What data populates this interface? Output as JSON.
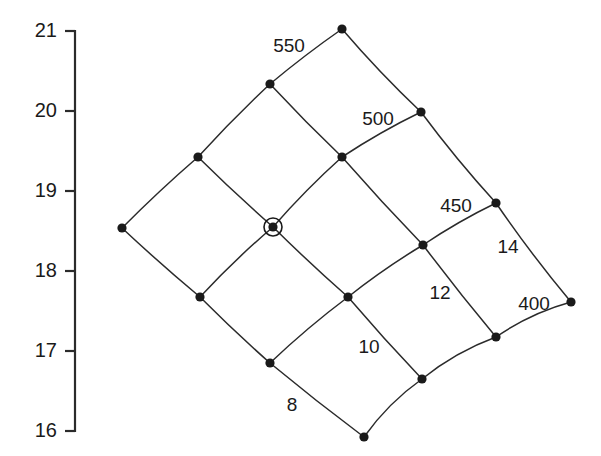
{
  "figure": {
    "background": "#ffffff",
    "ink": "#1a1a1a",
    "type": "curvilinear-grid-diagram"
  },
  "axis": {
    "name": "y-axis",
    "orientation": "vertical",
    "line": {
      "x": 75,
      "y_top": 31,
      "y_bottom": 431
    },
    "tick_length": 10,
    "ticks": [
      {
        "label": "21",
        "value": 21,
        "y": 31
      },
      {
        "label": "20",
        "value": 20,
        "y": 111
      },
      {
        "label": "19",
        "value": 19,
        "y": 191
      },
      {
        "label": "18",
        "value": 18,
        "y": 271
      },
      {
        "label": "17",
        "value": 17,
        "y": 351
      },
      {
        "label": "16",
        "value": 16,
        "y": 431
      }
    ]
  },
  "chart_data": {
    "type": "scatter",
    "title": "",
    "xlabel": "",
    "ylabel": "",
    "ylim": [
      16,
      21
    ],
    "grid": false,
    "iso_labels_family_a": [
      "550",
      "500",
      "450",
      "400"
    ],
    "iso_labels_family_b": [
      "8",
      "10",
      "12",
      "14"
    ],
    "nodes": [
      {
        "id": "n00",
        "x": 122,
        "y": 228,
        "highlight": false
      },
      {
        "id": "n01",
        "x": 198,
        "y": 157,
        "highlight": false
      },
      {
        "id": "n02",
        "x": 270,
        "y": 84,
        "highlight": false
      },
      {
        "id": "n03",
        "x": 342,
        "y": 29,
        "highlight": false
      },
      {
        "id": "n10",
        "x": 200,
        "y": 297,
        "highlight": false
      },
      {
        "id": "n11",
        "x": 273,
        "y": 227,
        "highlight": true
      },
      {
        "id": "n12",
        "x": 342,
        "y": 157,
        "highlight": false
      },
      {
        "id": "n13",
        "x": 421,
        "y": 112,
        "highlight": false
      },
      {
        "id": "n20",
        "x": 270,
        "y": 363,
        "highlight": false
      },
      {
        "id": "n21",
        "x": 348,
        "y": 297,
        "highlight": false
      },
      {
        "id": "n22",
        "x": 423,
        "y": 245,
        "highlight": false
      },
      {
        "id": "n23",
        "x": 496,
        "y": 203,
        "highlight": false
      },
      {
        "id": "n30",
        "x": 364,
        "y": 437,
        "highlight": false
      },
      {
        "id": "n31",
        "x": 422,
        "y": 379,
        "highlight": false
      },
      {
        "id": "n32",
        "x": 496,
        "y": 337,
        "highlight": false
      },
      {
        "id": "n33",
        "x": 571,
        "y": 302,
        "highlight": false
      }
    ],
    "labels": [
      {
        "text": "550",
        "x": 289,
        "y": 47
      },
      {
        "text": "500",
        "x": 378,
        "y": 120
      },
      {
        "text": "450",
        "x": 456,
        "y": 207
      },
      {
        "text": "400",
        "x": 534,
        "y": 305
      },
      {
        "text": "14",
        "x": 508,
        "y": 248
      },
      {
        "text": "12",
        "x": 440,
        "y": 294
      },
      {
        "text": "10",
        "x": 369,
        "y": 348
      },
      {
        "text": "8",
        "x": 292,
        "y": 406
      }
    ]
  }
}
